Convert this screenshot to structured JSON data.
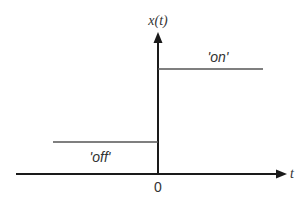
{
  "diagram": {
    "y_axis_label": "x(t)",
    "x_axis_label": "t",
    "origin_label": "0",
    "levels": [
      {
        "label": "'off'",
        "region": "t < 0",
        "level": "low"
      },
      {
        "label": "'on'",
        "region": "t > 0",
        "level": "high"
      }
    ],
    "colors": {
      "axis": "#1a1a1a",
      "signal": "#555555",
      "text": "#333333"
    }
  }
}
